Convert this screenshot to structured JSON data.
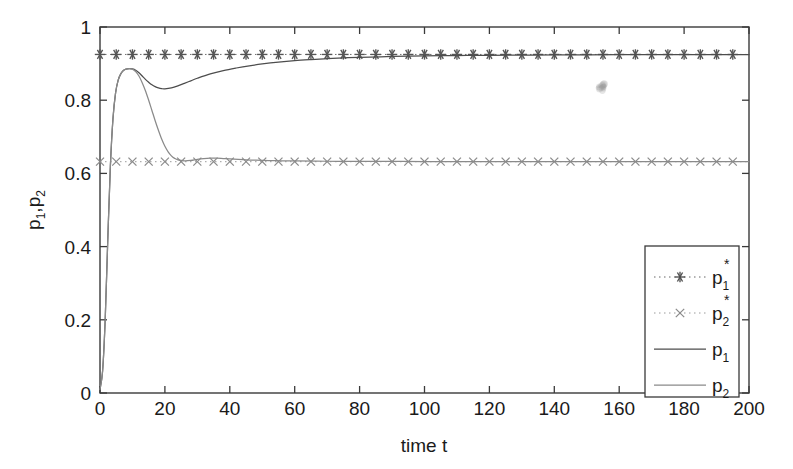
{
  "chart_data": {
    "type": "line",
    "title": "",
    "xlabel": "time t",
    "ylabel": "p_1,p_2",
    "ylabel_parts": {
      "p": "p",
      "sub1": "1",
      "comma": ",",
      "p2": "p",
      "sub2": "2"
    },
    "xlim": [
      0,
      200
    ],
    "ylim": [
      0,
      1
    ],
    "xticks": [
      0,
      20,
      40,
      60,
      80,
      100,
      120,
      140,
      160,
      180,
      200
    ],
    "xtick_labels": [
      "0",
      "20",
      "40",
      "60",
      "80",
      "100",
      "120",
      "140",
      "160",
      "180",
      "200"
    ],
    "yticks": [
      0,
      0.2,
      0.4,
      0.6,
      0.8,
      1
    ],
    "ytick_labels": [
      "0",
      "0.2",
      "0.4",
      "0.6",
      "0.8",
      "1"
    ],
    "grid": false,
    "legend_position": "lower right",
    "box": true,
    "series": [
      {
        "name": "p_1_star",
        "legend_label": "p",
        "legend_sub": "1",
        "legend_sup": "*",
        "style": "dotted-with-markers",
        "marker": "asterisk",
        "color": "#555555",
        "constant_value": 0.925,
        "marker_x_step": 5,
        "description": "Equilibrium value of p1, horizontal line of asterisk markers at 0.925"
      },
      {
        "name": "p_2_star",
        "legend_label": "p",
        "legend_sub": "2",
        "legend_sup": "*",
        "style": "dotted-with-markers",
        "marker": "cross",
        "color": "#8a8a8a",
        "constant_value": 0.632,
        "marker_x_step": 5,
        "description": "Equilibrium value of p2, horizontal line of x markers at 0.632"
      },
      {
        "name": "p_1",
        "legend_label": "p",
        "legend_sub": "1",
        "legend_sup": "",
        "style": "solid",
        "color": "#4d4d4d",
        "x": [
          0,
          0.8,
          1.6,
          2.4,
          3.2,
          4,
          4.8,
          5.6,
          6.4,
          7.2,
          8,
          9,
          10,
          11,
          12,
          13,
          14,
          15,
          16,
          17,
          18,
          19,
          20,
          22,
          24,
          26,
          28,
          30,
          34,
          38,
          42,
          46,
          50,
          55,
          60,
          65,
          70,
          75,
          80,
          90,
          100,
          110,
          120,
          140,
          160,
          180,
          200
        ],
        "y": [
          0.01,
          0.06,
          0.2,
          0.42,
          0.62,
          0.75,
          0.82,
          0.855,
          0.872,
          0.881,
          0.885,
          0.8865,
          0.8855,
          0.882,
          0.875,
          0.866,
          0.857,
          0.849,
          0.842,
          0.837,
          0.8335,
          0.8315,
          0.831,
          0.8335,
          0.839,
          0.846,
          0.853,
          0.86,
          0.872,
          0.881,
          0.888,
          0.894,
          0.899,
          0.904,
          0.908,
          0.911,
          0.9135,
          0.9155,
          0.917,
          0.9195,
          0.921,
          0.922,
          0.9228,
          0.9238,
          0.9243,
          0.9246,
          0.9248
        ],
        "description": "Price p1 transient: rises to peak 0.886 near t=9, dips to 0.831 at t=20, then asymptotes to 0.925"
      },
      {
        "name": "p_2",
        "legend_label": "p",
        "legend_sub": "2",
        "legend_sup": "",
        "style": "solid",
        "color": "#8a8a8a",
        "x": [
          0,
          0.8,
          1.6,
          2.4,
          3.2,
          4,
          4.8,
          5.6,
          6.4,
          7.2,
          8,
          9,
          10,
          11,
          12,
          13,
          14,
          15,
          16,
          17,
          18,
          19,
          20,
          21,
          22,
          23,
          24,
          26,
          28,
          30,
          32,
          34,
          36,
          38,
          40,
          44,
          48,
          52,
          56,
          60,
          70,
          80,
          100,
          120,
          140,
          160,
          180,
          200
        ],
        "y": [
          0.01,
          0.06,
          0.2,
          0.42,
          0.62,
          0.75,
          0.82,
          0.855,
          0.872,
          0.881,
          0.885,
          0.8865,
          0.885,
          0.878,
          0.866,
          0.848,
          0.826,
          0.8,
          0.772,
          0.744,
          0.718,
          0.694,
          0.674,
          0.659,
          0.648,
          0.641,
          0.637,
          0.6345,
          0.6355,
          0.6385,
          0.6405,
          0.6415,
          0.6415,
          0.6405,
          0.6395,
          0.6375,
          0.636,
          0.635,
          0.6345,
          0.634,
          0.6332,
          0.6328,
          0.6324,
          0.6322,
          0.6321,
          0.632,
          0.632,
          0.632
        ],
        "description": "Price p2 transient: shares peak 0.886 near t=9, falls to 0.6345 at t=26, small bump 0.6415 near t=34, settles at 0.632"
      }
    ],
    "artifact": {
      "name": "scan-smudge",
      "x": 155,
      "y": 0.84,
      "color": "#9a9a9a"
    }
  },
  "legend": {
    "entries": [
      {
        "label": "p",
        "sub": "1",
        "sup": "*",
        "marker": "asterisk",
        "style": "dotted"
      },
      {
        "label": "p",
        "sub": "2",
        "sup": "*",
        "marker": "cross",
        "style": "dotted"
      },
      {
        "label": "p",
        "sub": "1",
        "sup": "",
        "marker": "none",
        "style": "solid"
      },
      {
        "label": "p",
        "sub": "2",
        "sup": "",
        "marker": "none",
        "style": "solid"
      }
    ]
  },
  "colors": {
    "axis": "#3a3a3a",
    "text": "#1a1a1a",
    "series_dark": "#4d4d4d",
    "series_light": "#8a8a8a",
    "background": "#ffffff"
  }
}
